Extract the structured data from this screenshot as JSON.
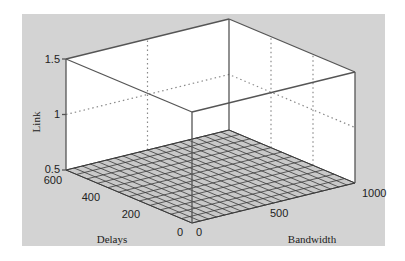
{
  "chart_data": {
    "type": "surface3d",
    "title": "",
    "xlabel": "Bandwidth",
    "ylabel": "Delays",
    "zlabel": "Link",
    "x_ticks": [
      "0",
      "500",
      "1000"
    ],
    "y_ticks": [
      "0",
      "200",
      "400",
      "600"
    ],
    "z_ticks": [
      "0.5",
      "1",
      "1.5"
    ],
    "xlim": [
      0,
      1000
    ],
    "ylim": [
      0,
      600
    ],
    "zlim": [
      0.5,
      1.5
    ],
    "grid": true,
    "mesh": {
      "x_divisions": 20,
      "y_divisions": 12
    },
    "surface_value": 0.5
  },
  "colors": {
    "page_bg": "#ffffff",
    "figure_bg": "#d3d3d3",
    "axes_bg": "#ffffff",
    "edge": "#555555",
    "mesh_fill": "#c9c9c9",
    "mesh_line": "#3a3a3a",
    "grid_dotted": "#8a8a8a",
    "text": "#222222"
  }
}
